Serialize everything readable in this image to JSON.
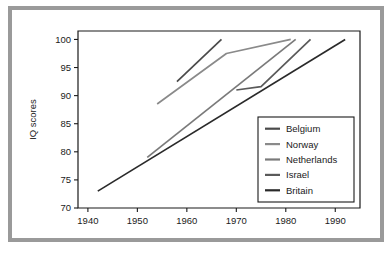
{
  "figure": {
    "frame_color": "#9a9a9a",
    "background": "#ffffff"
  },
  "chart_data": {
    "type": "line",
    "title": "",
    "xlabel": "",
    "ylabel": "IQ scores",
    "xlim": [
      1938,
      1995
    ],
    "ylim": [
      70,
      101.5
    ],
    "xticks": [
      1940,
      1950,
      1960,
      1970,
      1980,
      1990
    ],
    "xtick_labels": [
      "1940",
      "1950",
      "1960",
      "1970",
      "1980",
      "1990"
    ],
    "yticks": [
      70,
      75,
      80,
      85,
      90,
      95,
      100
    ],
    "ytick_labels": [
      "70",
      "75",
      "80",
      "85",
      "90",
      "95",
      "100"
    ],
    "grid": false,
    "legend_position": "lower-right-inside",
    "series": [
      {
        "name": "Belgium",
        "color": "#4a4a4a",
        "x": [
          1958,
          1967
        ],
        "y": [
          92.5,
          100.0
        ]
      },
      {
        "name": "Norway",
        "color": "#8a8a8a",
        "x": [
          1954,
          1968,
          1981
        ],
        "y": [
          88.5,
          97.5,
          100.0
        ]
      },
      {
        "name": "Netherlands",
        "color": "#7a7a7a",
        "x": [
          1952,
          1982
        ],
        "y": [
          79.0,
          100.0
        ]
      },
      {
        "name": "Israel",
        "color": "#5a5a5a",
        "x": [
          1970,
          1975,
          1985
        ],
        "y": [
          91.0,
          91.6,
          100.0
        ]
      },
      {
        "name": "Britain",
        "color": "#2a2a2a",
        "x": [
          1942,
          1992
        ],
        "y": [
          73.0,
          100.0
        ]
      }
    ]
  },
  "legend": {
    "items": [
      {
        "label": "Belgium",
        "color": "#4a4a4a"
      },
      {
        "label": "Norway",
        "color": "#8a8a8a"
      },
      {
        "label": "Netherlands",
        "color": "#7a7a7a"
      },
      {
        "label": "Israel",
        "color": "#5a5a5a"
      },
      {
        "label": "Britain",
        "color": "#2a2a2a"
      }
    ]
  }
}
